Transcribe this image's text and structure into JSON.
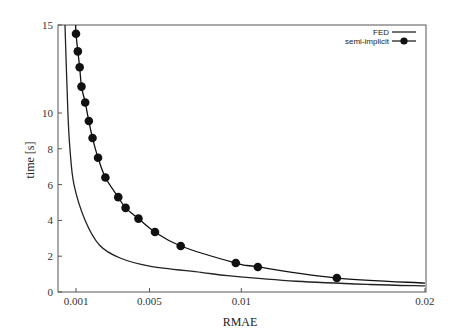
{
  "chart_data": {
    "type": "line",
    "title": "",
    "xlabel": "RMAE",
    "ylabel": "time [s]",
    "xlim": [
      0.0,
      0.0213
    ],
    "ylim": [
      0,
      15
    ],
    "x_ticks": [
      {
        "value": 0.001,
        "label": "0.001"
      },
      {
        "value": 0.005,
        "label": "0.005"
      },
      {
        "value": 0.01,
        "label": "0.01"
      },
      {
        "value": 0.02,
        "label": "0.02"
      }
    ],
    "y_ticks": [
      {
        "value": 0,
        "label": "0"
      },
      {
        "value": 2,
        "label": "2"
      },
      {
        "value": 4,
        "label": "4"
      },
      {
        "value": 6,
        "label": "6"
      },
      {
        "value": 8,
        "label": "8"
      },
      {
        "value": 10,
        "label": "10"
      },
      {
        "value": 15,
        "label": "15"
      }
    ],
    "y_axis_note": "broken scale: 0-10 linear, 10-15 compressed",
    "grid": false,
    "legend_position": "top-right",
    "series": [
      {
        "name": "FED",
        "style": "line",
        "color": "#222222",
        "points": [
          [
            0.0004,
            15.0
          ],
          [
            0.00056,
            10.0
          ],
          [
            0.00067,
            8.0
          ],
          [
            0.00089,
            6.0
          ],
          [
            0.0015,
            4.0
          ],
          [
            0.0023,
            2.6
          ],
          [
            0.0034,
            1.9
          ],
          [
            0.005,
            1.45
          ],
          [
            0.0078,
            1.1
          ],
          [
            0.0094,
            0.9
          ],
          [
            0.013,
            0.6
          ],
          [
            0.017,
            0.42
          ],
          [
            0.02,
            0.34
          ]
        ]
      },
      {
        "name": "semi-implicit",
        "style": "line+marker",
        "color": "#111111",
        "points": [
          [
            0.00098,
            15.0
          ],
          [
            0.001,
            14.5
          ],
          [
            0.0011,
            13.5
          ],
          [
            0.0012,
            12.6
          ],
          [
            0.0013,
            11.5
          ],
          [
            0.0015,
            10.6
          ],
          [
            0.0017,
            9.55
          ],
          [
            0.0019,
            8.6
          ],
          [
            0.0022,
            7.5
          ],
          [
            0.0026,
            6.4
          ],
          [
            0.0033,
            5.3
          ],
          [
            0.0037,
            4.7
          ],
          [
            0.0044,
            4.1
          ],
          [
            0.0053,
            3.35
          ],
          [
            0.0067,
            2.57
          ],
          [
            0.0097,
            1.62
          ],
          [
            0.0109,
            1.4
          ],
          [
            0.0152,
            0.78
          ],
          [
            0.02,
            0.5
          ]
        ],
        "marker_points": [
          [
            0.001,
            14.5
          ],
          [
            0.0011,
            13.5
          ],
          [
            0.0012,
            12.6
          ],
          [
            0.0013,
            11.5
          ],
          [
            0.0015,
            10.6
          ],
          [
            0.0017,
            9.55
          ],
          [
            0.0019,
            8.6
          ],
          [
            0.0022,
            7.5
          ],
          [
            0.0026,
            6.4
          ],
          [
            0.0033,
            5.3
          ],
          [
            0.0037,
            4.7
          ],
          [
            0.0044,
            4.1
          ],
          [
            0.0053,
            3.35
          ],
          [
            0.0067,
            2.57
          ],
          [
            0.0097,
            1.62
          ],
          [
            0.0109,
            1.4
          ],
          [
            0.0152,
            0.78
          ]
        ]
      }
    ]
  },
  "legend": {
    "items": [
      {
        "label": "FED"
      },
      {
        "label": "semi-implicit"
      }
    ]
  },
  "axes": {
    "xlabel": "RMAE",
    "ylabel": "time [s]"
  }
}
